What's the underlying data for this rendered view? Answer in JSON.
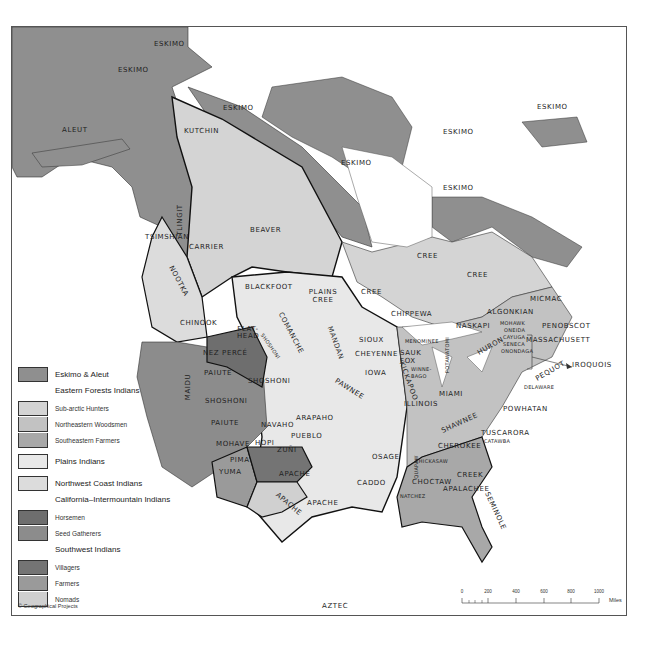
{
  "map": {
    "title": "North American Indian Cultural Areas",
    "colors": {
      "eskimo_aleut": "#8f8f8f",
      "subarctic_hunters": "#d4d4d4",
      "northeastern_woodsmen": "#c2c2c2",
      "southeastern_farmers": "#a8a8a8",
      "plains": "#e8e8e8",
      "northwest_coast": "#dcdcdc",
      "horsemen": "#6e6e6e",
      "seed_gatherers": "#8c8c8c",
      "villagers": "#747474",
      "farmers": "#9a9a9a",
      "nomads": "#d0d0d0",
      "water": "#ffffff",
      "border": "#1a1a1a"
    },
    "labels": {
      "eskimo_1": "ESKIMO",
      "eskimo_2": "ESKIMO",
      "eskimo_3": "ESKIMO",
      "eskimo_4": "ESKIMO",
      "eskimo_5": "ESKIMO",
      "eskimo_6": "ESKIMO",
      "eskimo_7": "ESKIMO",
      "aleut": "ALEUT",
      "kutchin": "KUTCHIN",
      "tlingit": "TLINGIT",
      "tsimshian": "TSIMSHIAN",
      "carrier": "CARRIER",
      "beaver": "BEAVER",
      "nootka": "NOOTKA",
      "chinook": "CHINOOK",
      "flathead": "FLAT-HEAD",
      "nez_perce": "NEZ PERCÉ",
      "shoshoni_small": "SHOSHONI",
      "paiute_1": "PAIUTE",
      "maidu": "MAIDU",
      "shoshoni_1": "SHOSHONI",
      "shoshoni_2": "SHOSHONI",
      "paiute_2": "PAIUTE",
      "mohave": "MOHAVE",
      "hopi": "HOPI",
      "navaho": "NAVAHO",
      "pueblo": "PUEBLO",
      "zuni": "ZUÑI",
      "pima": "PIMA",
      "yuma": "YUMA",
      "apache_1": "APACHE",
      "apache_2": "APACHE",
      "apache_3": "APACHE",
      "arapaho": "ARAPAHO",
      "blackfoot": "BLACKFOOT",
      "plains_cree": "PLAINS CREE",
      "comanche": "COMANCHE",
      "mandan": "MANDAN",
      "sioux": "SIOUX",
      "cheyenne": "CHEYENNE",
      "iowa": "IOWA",
      "pawnee": "PAWNEE",
      "osage": "OSAGE",
      "caddo": "CADDO",
      "cree_1": "CREE",
      "cree_2": "CREE",
      "cree_3": "CREE",
      "chippewa": "CHIPPEWA",
      "menominee": "MENOMINEE",
      "sauk_fox": "SAUK FOX",
      "kickapoo": "KICKAPOO",
      "winnebago": "WINNE-BAGO",
      "potawatomi": "POTAWATOMI",
      "huron": "HURON",
      "naskapi": "NASKAPI",
      "algonkian": "ALGONKIAN",
      "micmac": "MICMAC",
      "mohawk": "MOHAWK",
      "oneida": "ONEIDA",
      "cayuga": "CAYUGA",
      "seneca": "SENECA",
      "onondaga": "ONONDAGA",
      "penobscot": "PENOBSCOT",
      "massachusett": "MASSACHUSETT",
      "iroquois": "IROQUOIS",
      "pequot": "PEQUOT",
      "delaware": "DELAWARE",
      "illinois": "ILLINOIS",
      "miami": "MIAMI",
      "powhatan": "POWHATAN",
      "shawnee": "SHAWNEE",
      "tuscarora": "TUSCARORA",
      "catawba": "CATAWBA",
      "cherokee": "CHEROKEE",
      "quapaw": "QUAPAW",
      "chickasaw": "CHICKASAW",
      "choctaw": "CHOCTAW",
      "creek": "CREEK",
      "apalachee": "APALACHEE",
      "natchez": "NATCHEZ",
      "seminole": "SEMINOLE",
      "aztec": "AZTEC"
    }
  },
  "legend": {
    "eskimo_aleut": "Eskimo & Aleut",
    "eastern_forests": "Eastern Forests Indians",
    "subarctic": "Sub-arctic Hunters",
    "northeastern": "Northeastern Woodsmen",
    "southeastern": "Southeastern Farmers",
    "plains": "Plains Indians",
    "northwest_coast": "Northwest Coast Indians",
    "california": "California–Intermountain Indians",
    "horsemen": "Horsemen",
    "seed_gatherers": "Seed Gatherers",
    "southwest": "Southwest Indians",
    "villagers": "Villagers",
    "farmers": "Farmers",
    "nomads": "Nomads"
  },
  "copyright": "© Geographical Projects",
  "scale": {
    "ticks": [
      "0",
      "200",
      "400",
      "600",
      "800",
      "1000"
    ],
    "unit": "Miles"
  }
}
